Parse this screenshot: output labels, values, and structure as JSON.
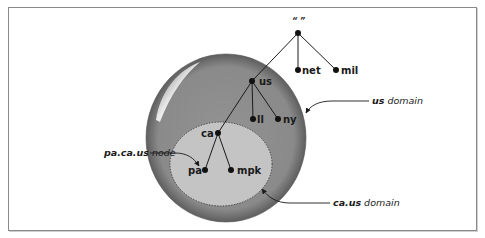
{
  "diagram": {
    "root": {
      "label": "“ ”"
    },
    "nodes": [
      {
        "id": "root",
        "label": "“ ”",
        "x": 298,
        "y": 33
      },
      {
        "id": "net",
        "label": "net",
        "x": 298,
        "y": 70
      },
      {
        "id": "mil",
        "label": "mil",
        "x": 336,
        "y": 70
      },
      {
        "id": "us",
        "label": "us",
        "x": 252,
        "y": 81
      },
      {
        "id": "ll",
        "label": "ll",
        "x": 253,
        "y": 119
      },
      {
        "id": "ny",
        "label": "ny",
        "x": 278,
        "y": 119
      },
      {
        "id": "ca",
        "label": "ca",
        "x": 218,
        "y": 133
      },
      {
        "id": "pa",
        "label": "pa",
        "x": 205,
        "y": 170
      },
      {
        "id": "mpk",
        "label": "mpk",
        "x": 231,
        "y": 170
      }
    ],
    "edges": [
      [
        "root",
        "net"
      ],
      [
        "root",
        "mil"
      ],
      [
        "root",
        "us"
      ],
      [
        "us",
        "ll"
      ],
      [
        "us",
        "ny"
      ],
      [
        "us",
        "ca"
      ],
      [
        "ca",
        "pa"
      ],
      [
        "ca",
        "mpk"
      ]
    ],
    "labels": {
      "root": "“ ”",
      "net": "net",
      "mil": "mil",
      "us": "us",
      "ll": "ll",
      "ny": "ny",
      "ca": "ca",
      "pa": "pa",
      "mpk": "mpk"
    },
    "domains": [
      {
        "id": "us-domain",
        "name": "us",
        "suffix": "domain",
        "fill": "#8e8e8e"
      },
      {
        "id": "ca-us-domain",
        "name": "ca.us",
        "suffix": "domain",
        "fill": "#c4c4c4",
        "border": "dotted"
      }
    ],
    "callouts": {
      "us_domain": {
        "bold": "us",
        "plain": " domain"
      },
      "ca_us_domain": {
        "bold": "ca.us",
        "plain": " domain"
      },
      "pa_node": {
        "bold": "pa.ca.us",
        "plain": " node"
      }
    },
    "colors": {
      "outer_domain": "#8e8e8e",
      "outer_rim": "#6b6b6b",
      "inner_domain": "#c4c4c4",
      "line": "#1a1a1a",
      "frame": "#8a8a8a"
    }
  }
}
